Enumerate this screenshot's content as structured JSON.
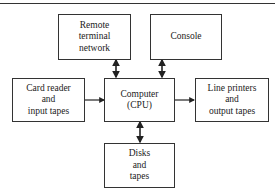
{
  "diagram": {
    "type": "block-diagram",
    "nodes": [
      {
        "id": "remote",
        "label": "Remote\nterminal\nnetwork"
      },
      {
        "id": "console",
        "label": "Console"
      },
      {
        "id": "card",
        "label": "Card reader\nand\ninput tapes"
      },
      {
        "id": "cpu",
        "label": "Computer\n(CPU)"
      },
      {
        "id": "printers",
        "label": "Line printers\nand\noutput tapes"
      },
      {
        "id": "disks",
        "label": "Disks\nand\ntapes"
      }
    ],
    "edges": [
      {
        "from": "remote",
        "to": "cpu",
        "direction": "bidirectional"
      },
      {
        "from": "console",
        "to": "cpu",
        "direction": "bidirectional"
      },
      {
        "from": "card",
        "to": "cpu",
        "direction": "forward"
      },
      {
        "from": "cpu",
        "to": "printers",
        "direction": "forward"
      },
      {
        "from": "cpu",
        "to": "disks",
        "direction": "bidirectional"
      }
    ]
  }
}
